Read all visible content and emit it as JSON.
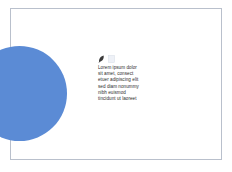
{
  "slide": {
    "background_color": "#ffffff",
    "border_color": "#b9c0cc",
    "shape": {
      "name": "circle",
      "color": "#5b8bd5"
    },
    "icons": {
      "leaf": "leaf-icon",
      "quote": "quote-icon"
    },
    "text_block": {
      "color": "#2d2d2d",
      "lines": [
        "Lorem ipsum dolor",
        "sit amet, consect",
        "etuer adipiscing elit",
        "sed diam nonummy",
        "nibh euismod",
        "tincidunt ut laoreet"
      ]
    }
  }
}
